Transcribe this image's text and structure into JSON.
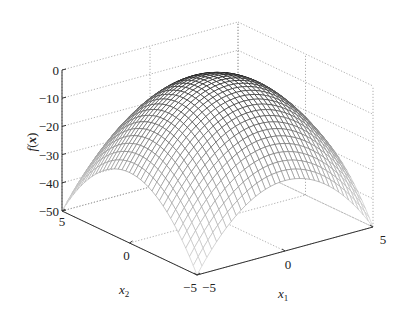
{
  "chart_data": {
    "type": "surface",
    "title": "",
    "function": "f(x) = -(x1^2 + x2^2)",
    "xlabel": "x1",
    "ylabel": "x2",
    "zlabel": "f(x)",
    "x1_ticks": [
      "-5",
      "0",
      "5"
    ],
    "x2_ticks": [
      "-5",
      "0",
      "5"
    ],
    "z_ticks": [
      "0",
      "-10",
      "-20",
      "-30",
      "-40",
      "-50"
    ],
    "x1_range": [
      -5,
      5
    ],
    "x2_range": [
      -5,
      5
    ],
    "zlim": [
      -50,
      0
    ],
    "grid": true,
    "grid_style": "dotted",
    "mesh": "grayscale wireframe, darker near peak",
    "samples": {
      "x1": [
        -5,
        -2.5,
        0,
        2.5,
        5
      ],
      "x2": [
        -5,
        -2.5,
        0,
        2.5,
        5
      ],
      "z": [
        [
          -50,
          -31.25,
          -25,
          -31.25,
          -50
        ],
        [
          -31.25,
          -12.5,
          -6.25,
          -12.5,
          -31.25
        ],
        [
          -25,
          -6.25,
          0,
          -6.25,
          -25
        ],
        [
          -31.25,
          -12.5,
          -6.25,
          -12.5,
          -31.25
        ],
        [
          -50,
          -31.25,
          -25,
          -31.25,
          -50
        ]
      ]
    }
  },
  "labels": {
    "zlabel_main": "f",
    "zlabel_paren_open": "(",
    "zlabel_var": "x",
    "zlabel_paren_close": ")",
    "x1_main": "x",
    "x1_sub": "1",
    "x2_main": "x",
    "x2_sub": "2"
  },
  "colors": {
    "axis": "#333333",
    "grid": "#9a9a9a",
    "mesh_dark": "#111111",
    "mesh_light": "#c8c8c8"
  }
}
